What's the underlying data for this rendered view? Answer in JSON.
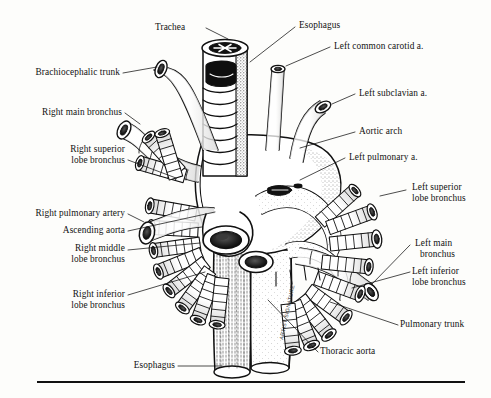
{
  "figure": {
    "medium": "pen-and-ink stipple line drawing",
    "ink_color": "#111111",
    "paper_color": "#fdfdfb",
    "artist_signature": "ARTIST SIGNATURE",
    "rule_label": "bottom-rule"
  },
  "labels": {
    "trachea": "Trachea",
    "esophagus_top": "Esophagus",
    "left_common_carotid": "Left common carotid a.",
    "left_subclavian": "Left subclavian a.",
    "aortic_arch": "Aortic arch",
    "left_pulmonary": "Left pulmonary a.",
    "brachiocephalic_trunk": "Brachiocephalic trunk",
    "right_main_bronchus": "Right main bronchus",
    "right_superior_lobe_1": "Right superior",
    "right_superior_lobe_2": "lobe bronchus",
    "left_superior_lobe_1": "Left superior",
    "left_superior_lobe_2": "lobe bronchus",
    "right_pulmonary_artery": "Right pulmonary artery",
    "ascending_aorta": "Ascending aorta",
    "right_middle_lobe_1": "Right middle",
    "right_middle_lobe_2": "lobe bronchus",
    "left_main_bronchus_1": "Left main",
    "left_main_bronchus_2": "bronchus",
    "left_inferior_lobe_1": "Left inferior",
    "left_inferior_lobe_2": "lobe bronchus",
    "right_inferior_lobe_1": "Right inferior",
    "right_inferior_lobe_2": "lobe bronchus",
    "pulmonary_trunk": "Pulmonary trunk",
    "thoracic_aorta": "Thoracic aorta",
    "esophagus_bottom": "Esophagus"
  }
}
